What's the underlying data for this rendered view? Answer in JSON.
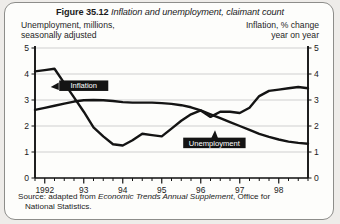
{
  "figure": {
    "number": "Figure 35.12",
    "caption": "Inflation and unemployment, claimant count"
  },
  "axis_headers": {
    "left_line1": "Unemployment, millions,",
    "left_line2": "seasonally adjusted",
    "right_line1": "Inflation, % change",
    "right_line2": "year on year"
  },
  "source": {
    "prefix": "Source: adapted from ",
    "italic": "Economic Trends Annual Supplement",
    "suffix": ", Office for",
    "line2": "National  Statistics."
  },
  "labels": {
    "inflation": "Inflation",
    "unemployment": "Unemployment"
  },
  "colors": {
    "line": "#141414",
    "grid": "#c9c9c9",
    "axis": "#141414",
    "label_box": "#141414",
    "label_text": "#ffffff",
    "card": "#fdfdfb",
    "page": "#eeece9"
  },
  "chart_data": {
    "type": "line",
    "title": "Inflation and unemployment, claimant count",
    "xlabel": "",
    "ylabel_left": "Unemployment, millions, seasonally adjusted",
    "ylabel_right": "Inflation, % change year on year",
    "grid": true,
    "legend": "inline-callout",
    "xlim": [
      1991.75,
      1998.75
    ],
    "ylim_left": [
      0,
      5
    ],
    "ylim_right": [
      0,
      5
    ],
    "yticks_left": [
      "0",
      "1",
      "2",
      "3",
      "4",
      "5"
    ],
    "yticks_right": [
      "0",
      "1",
      "2",
      "3",
      "4",
      "5"
    ],
    "xticks_major": [
      "1992",
      "93",
      "94",
      "95",
      "96",
      "97",
      "98"
    ],
    "x_major_values": [
      1992,
      1993,
      1994,
      1995,
      1996,
      1997,
      1998
    ],
    "minor_ticks_per_year": 4,
    "x": [
      1991.75,
      1992.0,
      1992.25,
      1992.5,
      1992.75,
      1993.0,
      1993.25,
      1993.5,
      1993.75,
      1994.0,
      1994.25,
      1994.5,
      1994.75,
      1995.0,
      1995.25,
      1995.5,
      1995.75,
      1996.0,
      1996.25,
      1996.5,
      1996.75,
      1997.0,
      1997.25,
      1997.5,
      1997.75,
      1998.0,
      1998.25,
      1998.5,
      1998.75
    ],
    "series": [
      {
        "name": "Inflation",
        "axis": "right",
        "unit": "% change year on year",
        "values": [
          4.1,
          4.15,
          4.2,
          3.65,
          3.1,
          2.55,
          1.95,
          1.6,
          1.3,
          1.25,
          1.45,
          1.7,
          1.65,
          1.6,
          1.9,
          2.2,
          2.45,
          2.6,
          2.35,
          2.55,
          2.55,
          2.5,
          2.7,
          3.15,
          3.35,
          3.4,
          3.45,
          3.5,
          3.45
        ]
      },
      {
        "name": "Unemployment",
        "axis": "left",
        "unit": "millions",
        "values": [
          2.62,
          2.7,
          2.78,
          2.86,
          2.94,
          2.99,
          3.0,
          2.99,
          2.96,
          2.92,
          2.9,
          2.9,
          2.9,
          2.88,
          2.85,
          2.8,
          2.72,
          2.6,
          2.45,
          2.3,
          2.15,
          2.0,
          1.85,
          1.7,
          1.58,
          1.48,
          1.4,
          1.35,
          1.32
        ]
      }
    ],
    "annotations": [
      {
        "text": "Inflation",
        "x": 1993.0,
        "y": 3.55,
        "style": "black-box-white-text",
        "arrow": "left"
      },
      {
        "text": "Unemployment",
        "x": 1996.35,
        "y": 1.35,
        "style": "black-box-white-text",
        "arrow": "up"
      }
    ]
  }
}
